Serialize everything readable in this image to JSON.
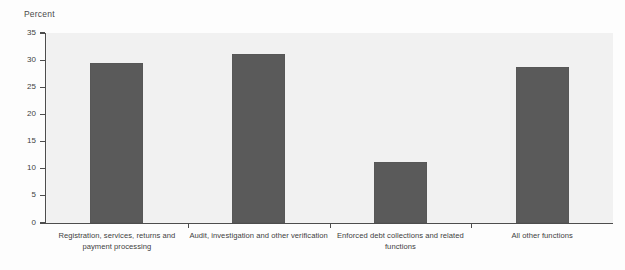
{
  "chart_data": {
    "type": "bar",
    "title": "",
    "subtitle": "",
    "xlabel": "",
    "ylabel": "Percent",
    "ylim": [
      0,
      35
    ],
    "grid": false,
    "legend": false,
    "legend_position": "none",
    "orientation": "vertical",
    "bar_color": "#5a5a5a",
    "plot_background": "#f1f1f1",
    "axis_color": "#4d4d4d",
    "categories": [
      "Registration, services, returns and payment processing",
      "Audit, investigation and other verification",
      "Enforced debt collections and related functions",
      "All other functions"
    ],
    "category_lines": [
      [
        "Registration, services, returns and",
        "payment processing"
      ],
      [
        "Audit, investigation and other verification"
      ],
      [
        "Enforced debt collections and related",
        "functions"
      ],
      [
        "All other functions"
      ]
    ],
    "values": [
      29.4,
      31.1,
      11.2,
      28.8
    ],
    "yticks": [
      0,
      5,
      10,
      15,
      20,
      25,
      30,
      35
    ],
    "ytick_labels": [
      "0",
      "5",
      "10",
      "15",
      "20",
      "25",
      "30",
      "35"
    ]
  }
}
